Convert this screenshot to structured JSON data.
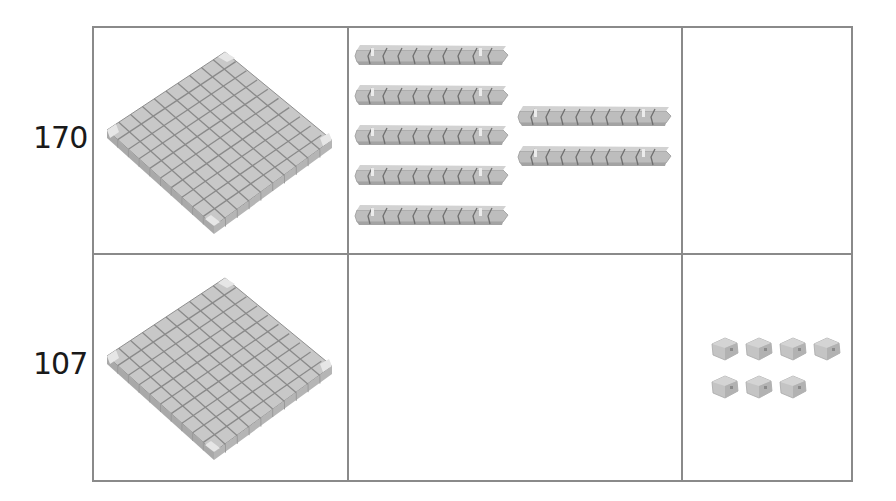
{
  "rows": [
    {
      "number": "170",
      "hundreds": {
        "count": 1,
        "block": "flat"
      },
      "tens": {
        "count": 7,
        "block": "rod"
      },
      "ones": {
        "count": 0,
        "block": "unit-cube"
      }
    },
    {
      "number": "107",
      "hundreds": {
        "count": 1,
        "block": "flat"
      },
      "tens": {
        "count": 0,
        "block": "rod"
      },
      "ones": {
        "count": 7,
        "block": "unit-cube"
      }
    }
  ],
  "colors": {
    "block_top": "#c9c9c9",
    "block_side": "#b0b0b0",
    "block_edge": "#7a7a7a",
    "grid_border": "#8a8a8a"
  }
}
